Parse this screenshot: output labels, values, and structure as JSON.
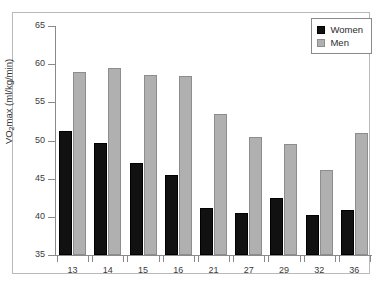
{
  "chart_data": {
    "type": "bar",
    "title": "",
    "xlabel": "",
    "ylabel": "VO2max (ml/kg/min)",
    "ylabel_parts": {
      "pre": "VO",
      "sub": "2",
      "post": "max (ml/kg/min)"
    },
    "categories": [
      "13",
      "14",
      "15",
      "16",
      "21",
      "27",
      "29",
      "32",
      "36"
    ],
    "series": [
      {
        "name": "Women",
        "color": "#111111",
        "values": [
          51.2,
          49.7,
          47.0,
          45.5,
          41.1,
          40.5,
          42.5,
          40.2,
          40.9
        ]
      },
      {
        "name": "Men",
        "color": "#b0b0b0",
        "values": [
          59.0,
          59.5,
          58.6,
          58.4,
          53.5,
          50.4,
          49.5,
          46.1,
          51.0
        ]
      }
    ],
    "ylim": [
      35,
      65
    ],
    "yticks": [
      35,
      40,
      45,
      50,
      55,
      60,
      65
    ],
    "ytick_labels": [
      "35",
      "40",
      "45",
      "50",
      "55",
      "60",
      "65"
    ],
    "grid": false,
    "legend_position": "top-right"
  },
  "legend": {
    "entries": [
      {
        "label": "Women"
      },
      {
        "label": "Men"
      }
    ]
  }
}
